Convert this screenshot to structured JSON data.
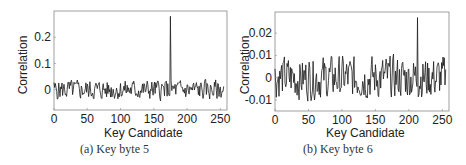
{
  "chart_data": [
    {
      "type": "line",
      "title": "",
      "caption": "(a) Key byte 5",
      "xlabel": "Key Candidate",
      "ylabel": "Correlation",
      "xlim": [
        0,
        260
      ],
      "ylim": [
        -0.077,
        0.3
      ],
      "xticks": [
        0,
        50,
        100,
        150,
        200,
        250
      ],
      "xtick_labels": [
        "0",
        "50",
        "100",
        "150",
        "200",
        "250"
      ],
      "yticks": [
        0,
        0.1,
        0.2
      ],
      "ytick_labels": [
        "0",
        "0.1",
        "0.2"
      ],
      "grid": false,
      "legend": null,
      "peak": {
        "x": 175,
        "y": 0.28
      },
      "noise_range": [
        -0.065,
        0.05
      ],
      "series": [
        {
          "name": "correlation",
          "color": "#1a1a1a",
          "n_points": 256,
          "baseline": 0.0,
          "amplitude": 0.022,
          "seed": 5
        }
      ]
    },
    {
      "type": "line",
      "title": "",
      "caption": "(b) Key byte 6",
      "xlabel": "Key Candidate",
      "ylabel": "Correlation",
      "xlim": [
        0,
        260
      ],
      "ylim": [
        -0.015,
        0.0295
      ],
      "xticks": [
        0,
        50,
        100,
        150,
        200,
        250
      ],
      "xtick_labels": [
        "0",
        "50",
        "100",
        "150",
        "200",
        "250"
      ],
      "yticks": [
        -0.01,
        0,
        0.01,
        0.02
      ],
      "ytick_labels": [
        "-0.01",
        "0",
        "0.01",
        "0.02"
      ],
      "grid": false,
      "legend": null,
      "peak": {
        "x": 213,
        "y": 0.027
      },
      "noise_range": [
        -0.0145,
        0.0125
      ],
      "series": [
        {
          "name": "correlation",
          "color": "#1a1a1a",
          "n_points": 256,
          "baseline": 0.0,
          "amplitude": 0.0055,
          "seed": 6
        }
      ]
    }
  ],
  "panels": [
    {
      "caption": "(a) Key byte 5",
      "xlabel": "Key Candidate",
      "ylabel": "Correlation"
    },
    {
      "caption": "(b) Key byte 6",
      "xlabel": "Key Candidate",
      "ylabel": "Correlation"
    }
  ]
}
